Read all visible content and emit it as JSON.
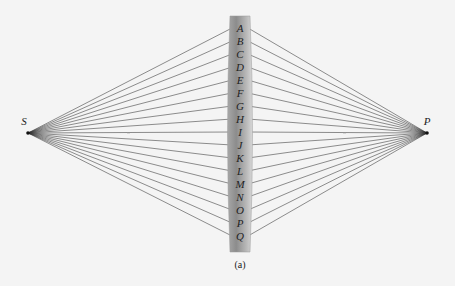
{
  "diagram": {
    "source_label": "S",
    "image_label": "P",
    "caption": "(a)",
    "lens_point_labels": [
      "A",
      "B",
      "C",
      "D",
      "E",
      "F",
      "G",
      "H",
      "I",
      "J",
      "K",
      "L",
      "M",
      "N",
      "O",
      "P",
      "Q"
    ],
    "colors": {
      "background": "#f4f4f4",
      "ray": "#333333",
      "lens_dark": "#8f8f8f",
      "lens_light": "#d4d4d4",
      "text": "#222222"
    },
    "geometry": {
      "source": [
        28,
        133
      ],
      "image": [
        427,
        133
      ],
      "lens_left_x": 228,
      "lens_right_x": 252,
      "lens_top_y": 16,
      "lens_bottom_y": 252,
      "first_label_y": 28,
      "label_spacing": 13
    }
  }
}
